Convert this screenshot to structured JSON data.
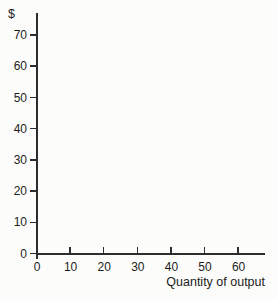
{
  "chart_data": {
    "type": "line",
    "title": "",
    "xlabel": "Quantity of output",
    "ylabel": "$",
    "x_ticks": [
      0,
      10,
      20,
      30,
      40,
      50,
      60
    ],
    "y_ticks": [
      0,
      10,
      20,
      30,
      40,
      50,
      60,
      70
    ],
    "xlim": [
      0,
      68
    ],
    "ylim": [
      0,
      77
    ],
    "series": [],
    "grid": false,
    "legend": null,
    "axis_color": "#2d2d2d",
    "text_color": "#1c1c1c",
    "background": "#fcfcfa"
  }
}
